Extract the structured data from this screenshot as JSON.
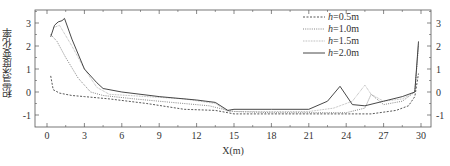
{
  "chart_data": {
    "type": "line",
    "title": "",
    "xlabel": "X(m)",
    "ylabel": "积雪深度变化率",
    "xlim": [
      -1,
      31
    ],
    "ylim": [
      -1.5,
      3.5
    ],
    "xticks": [
      0,
      3,
      6,
      9,
      12,
      15,
      18,
      21,
      24,
      27,
      30
    ],
    "yticks": [
      -1,
      0,
      1,
      2,
      3
    ],
    "grid": false,
    "legend_position": "upper right",
    "series": [
      {
        "name": "h=0.5m",
        "style": "dashed",
        "x": [
          0.3,
          0.5,
          1.0,
          2.0,
          3.0,
          5.0,
          8.0,
          11.0,
          13.5,
          14.5,
          15.0,
          18.0,
          21.0,
          24.0,
          26.0,
          28.0,
          29.0,
          29.5,
          29.8
        ],
        "y": [
          0.7,
          0.1,
          -0.05,
          -0.15,
          -0.2,
          -0.3,
          -0.5,
          -0.75,
          -0.8,
          -0.9,
          -0.95,
          -0.95,
          -0.95,
          -0.95,
          -0.95,
          -0.8,
          -0.6,
          -0.2,
          0.8
        ]
      },
      {
        "name": "h=1.0m",
        "style": "dotted",
        "x": [
          0.3,
          0.8,
          1.5,
          2.5,
          3.5,
          4.5,
          7.0,
          10.0,
          13.0,
          14.5,
          15.0,
          18.0,
          21.0,
          24.0,
          25.5,
          26.0,
          27.0,
          28.5,
          29.5,
          29.8
        ],
        "y": [
          2.5,
          2.2,
          1.5,
          0.6,
          0.0,
          -0.15,
          -0.3,
          -0.45,
          -0.6,
          -0.8,
          -0.85,
          -0.9,
          -0.9,
          -0.9,
          -0.7,
          -0.1,
          -0.55,
          -0.4,
          0.0,
          2.0
        ]
      },
      {
        "name": "h=1.5m",
        "style": "dotted-fine",
        "x": [
          0.5,
          1.0,
          2.0,
          3.0,
          4.0,
          5.0,
          8.0,
          11.0,
          13.5,
          14.5,
          15.0,
          18.0,
          21.0,
          23.0,
          24.5,
          25.5,
          26.0,
          27.0,
          28.5,
          29.5,
          29.8
        ],
        "y": [
          2.8,
          2.9,
          2.0,
          1.0,
          0.2,
          -0.1,
          -0.2,
          -0.3,
          -0.5,
          -0.85,
          -0.85,
          -0.85,
          -0.85,
          -0.7,
          -0.4,
          0.3,
          -0.1,
          -0.4,
          -0.3,
          0.0,
          2.1
        ]
      },
      {
        "name": "h=2.0m",
        "style": "solid",
        "x": [
          0.3,
          0.6,
          0.9,
          1.2,
          1.4,
          2.0,
          3.0,
          4.0,
          4.5,
          6.0,
          9.0,
          12.0,
          13.5,
          14.5,
          15.0,
          18.0,
          21.0,
          22.5,
          23.5,
          24.5,
          25.5,
          27.0,
          28.5,
          29.5,
          29.8
        ],
        "y": [
          2.4,
          2.9,
          3.05,
          3.1,
          3.2,
          2.3,
          1.0,
          0.4,
          0.15,
          0.0,
          -0.2,
          -0.35,
          -0.45,
          -0.8,
          -0.75,
          -0.75,
          -0.75,
          -0.4,
          0.25,
          -0.55,
          -0.6,
          -0.4,
          -0.2,
          0.0,
          2.2
        ]
      }
    ]
  },
  "legend": {
    "items": [
      {
        "label": "h=0.5m",
        "italic": "h",
        "rest": "=0.5m"
      },
      {
        "label": "h=1.0m",
        "italic": "h",
        "rest": "=1.0m"
      },
      {
        "label": "h=1.5m",
        "italic": "h",
        "rest": "=1.5m"
      },
      {
        "label": "h=2.0m",
        "italic": "h",
        "rest": "=2.0m"
      }
    ]
  },
  "axes": {
    "xlabel": "X(m)",
    "ylabel": "积雪深度变化率"
  }
}
